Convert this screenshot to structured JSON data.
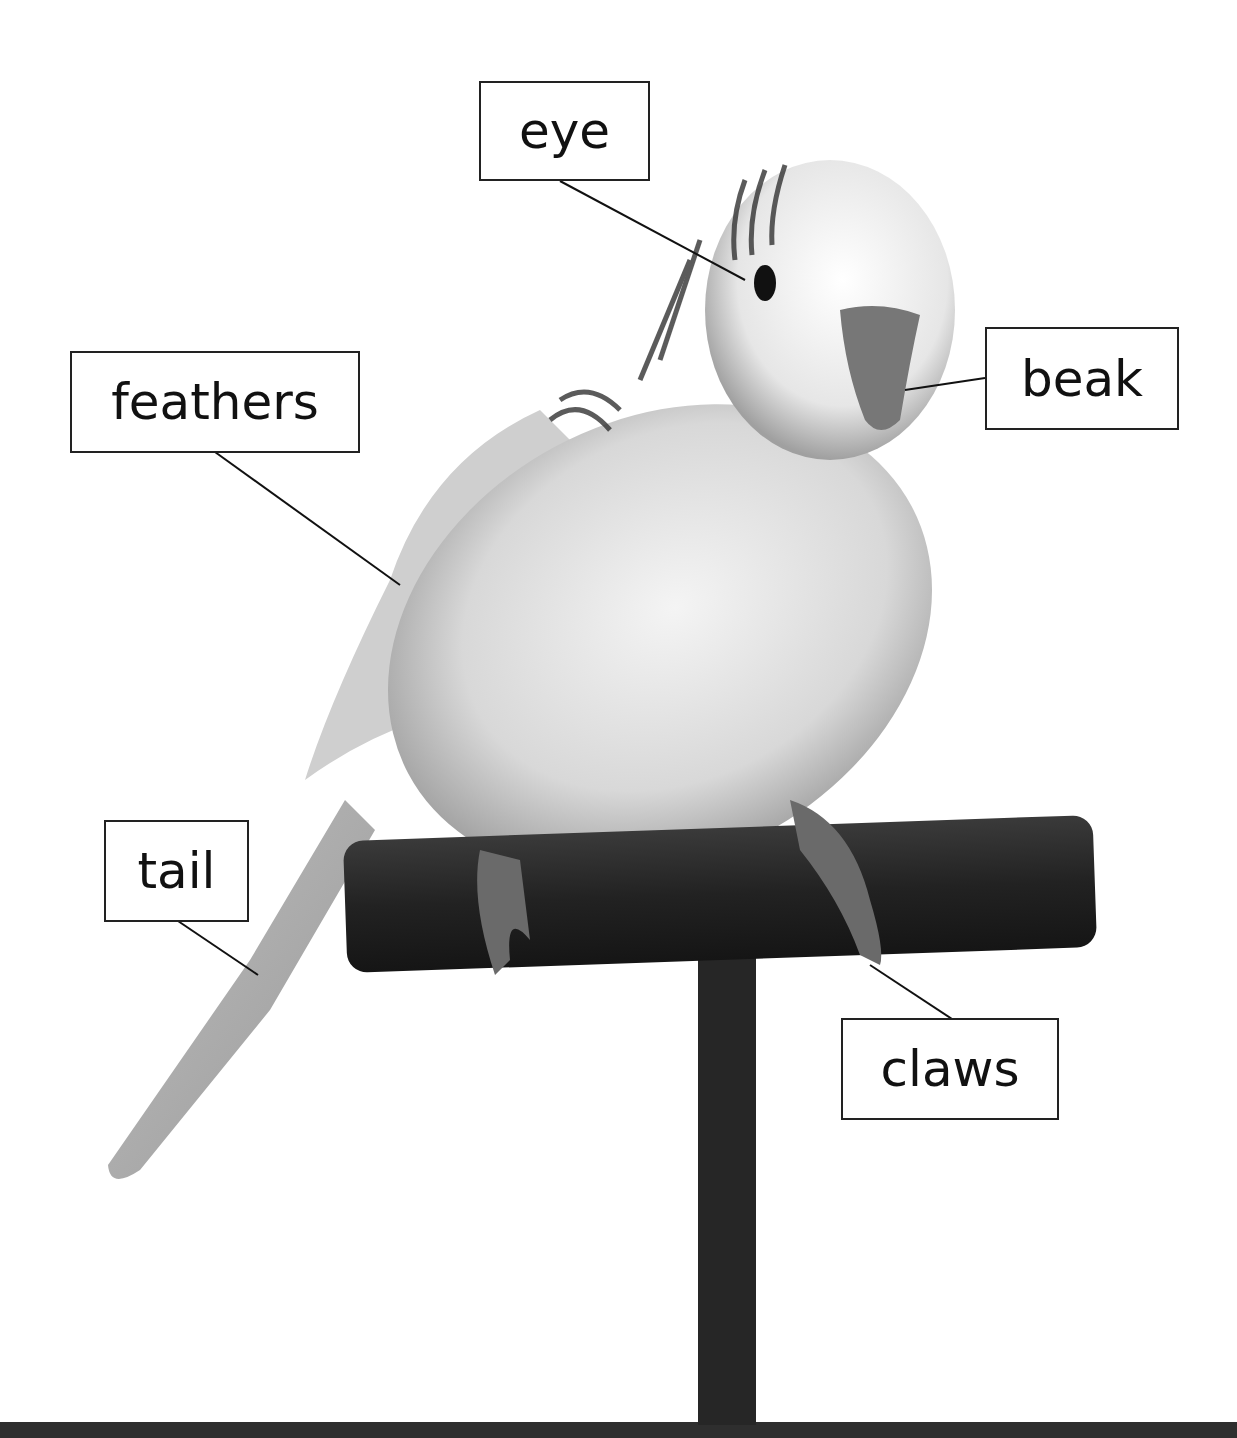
{
  "diagram": {
    "labels": [
      {
        "id": "eye",
        "text": "eye"
      },
      {
        "id": "beak",
        "text": "beak"
      },
      {
        "id": "feathers",
        "text": "feathers"
      },
      {
        "id": "tail",
        "text": "tail"
      },
      {
        "id": "claws",
        "text": "claws"
      }
    ]
  }
}
